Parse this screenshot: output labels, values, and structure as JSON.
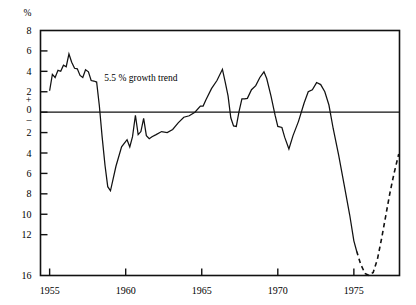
{
  "chart_data": {
    "type": "line",
    "title": "",
    "xlabel": "",
    "ylabel": "%",
    "unit_label": "%",
    "xlim": [
      1954.4,
      1978.0
    ],
    "ylim": [
      -16,
      8
    ],
    "grid": false,
    "legend": "none",
    "yticks": [
      8,
      6,
      4,
      2,
      0,
      -2,
      -4,
      -6,
      -8,
      -10,
      -12,
      -16
    ],
    "ytick_labels": [
      "8",
      "6",
      "4",
      "2",
      "0",
      "2",
      "4",
      "6",
      "8",
      "10",
      "12",
      "16"
    ],
    "y_zero_plus": "+",
    "y_zero_minus": "–",
    "xticks": [
      1955,
      1960,
      1965,
      1970,
      1975
    ],
    "xtick_labels": [
      "1955",
      "1960",
      "1965",
      "1970",
      "1975"
    ],
    "x_minor_ticks": [
      1955,
      1960,
      1965,
      1970,
      1975
    ],
    "annotations": [
      {
        "text": "5.5 % growth trend",
        "x": 1961.0,
        "y": 3.1
      }
    ],
    "reference_lines": [
      {
        "name": "zero-line",
        "y": 0,
        "style": "solid"
      }
    ],
    "series": [
      {
        "name": "growth-rate-actual",
        "style": "solid",
        "color": "#111111",
        "points": [
          [
            1955.0,
            2.1
          ],
          [
            1955.18,
            3.7
          ],
          [
            1955.36,
            3.4
          ],
          [
            1955.55,
            4.1
          ],
          [
            1955.73,
            4.0
          ],
          [
            1955.91,
            4.6
          ],
          [
            1956.09,
            4.45
          ],
          [
            1956.27,
            5.7
          ],
          [
            1956.45,
            4.9
          ],
          [
            1956.64,
            4.3
          ],
          [
            1956.82,
            4.25
          ],
          [
            1957.0,
            3.6
          ],
          [
            1957.18,
            3.4
          ],
          [
            1957.36,
            4.15
          ],
          [
            1957.55,
            3.95
          ],
          [
            1957.73,
            3.1
          ],
          [
            1957.91,
            3.05
          ],
          [
            1958.09,
            2.95
          ],
          [
            1958.27,
            0.6
          ],
          [
            1958.45,
            -2.4
          ],
          [
            1958.64,
            -5.2
          ],
          [
            1958.82,
            -7.3
          ],
          [
            1959.0,
            -7.7
          ],
          [
            1959.36,
            -5.3
          ],
          [
            1959.73,
            -3.4
          ],
          [
            1960.09,
            -2.7
          ],
          [
            1960.27,
            -3.4
          ],
          [
            1960.45,
            -2.4
          ],
          [
            1960.64,
            -0.3
          ],
          [
            1960.82,
            -2.2
          ],
          [
            1961.0,
            -1.9
          ],
          [
            1961.18,
            -0.6
          ],
          [
            1961.36,
            -2.3
          ],
          [
            1961.55,
            -2.6
          ],
          [
            1961.73,
            -2.4
          ],
          [
            1962.0,
            -2.2
          ],
          [
            1962.36,
            -1.9
          ],
          [
            1962.73,
            -2.0
          ],
          [
            1963.09,
            -1.7
          ],
          [
            1963.45,
            -1.05
          ],
          [
            1963.82,
            -0.5
          ],
          [
            1964.18,
            -0.35
          ],
          [
            1964.55,
            0.0
          ],
          [
            1964.91,
            0.6
          ],
          [
            1965.09,
            0.6
          ],
          [
            1965.27,
            1.2
          ],
          [
            1965.64,
            2.3
          ],
          [
            1966.0,
            3.1
          ],
          [
            1966.36,
            4.2
          ],
          [
            1966.55,
            2.9
          ],
          [
            1966.73,
            1.6
          ],
          [
            1966.91,
            -0.55
          ],
          [
            1967.09,
            -1.35
          ],
          [
            1967.27,
            -1.4
          ],
          [
            1967.45,
            0.05
          ],
          [
            1967.64,
            1.3
          ],
          [
            1967.82,
            1.3
          ],
          [
            1968.0,
            1.35
          ],
          [
            1968.27,
            2.2
          ],
          [
            1968.55,
            2.6
          ],
          [
            1968.82,
            3.4
          ],
          [
            1969.09,
            3.95
          ],
          [
            1969.27,
            3.3
          ],
          [
            1969.55,
            1.6
          ],
          [
            1969.82,
            -0.3
          ],
          [
            1970.0,
            -1.4
          ],
          [
            1970.27,
            -1.5
          ],
          [
            1970.45,
            -2.45
          ],
          [
            1970.73,
            -3.6
          ],
          [
            1971.0,
            -2.3
          ],
          [
            1971.36,
            -0.9
          ],
          [
            1971.73,
            0.9
          ],
          [
            1972.0,
            2.0
          ],
          [
            1972.27,
            2.2
          ],
          [
            1972.55,
            2.9
          ],
          [
            1972.82,
            2.7
          ],
          [
            1973.09,
            2.0
          ],
          [
            1973.36,
            0.7
          ],
          [
            1973.64,
            -1.6
          ],
          [
            1974.0,
            -4.2
          ],
          [
            1974.36,
            -7.1
          ],
          [
            1974.73,
            -10.1
          ],
          [
            1975.0,
            -12.6
          ],
          [
            1975.18,
            -13.6
          ]
        ]
      },
      {
        "name": "growth-rate-projected",
        "style": "dashed",
        "color": "#111111",
        "points": [
          [
            1975.18,
            -13.6
          ],
          [
            1975.45,
            -14.9
          ],
          [
            1975.73,
            -15.8
          ],
          [
            1976.0,
            -16.0
          ],
          [
            1976.27,
            -15.7
          ],
          [
            1976.55,
            -14.4
          ],
          [
            1976.82,
            -12.4
          ],
          [
            1977.09,
            -10.2
          ],
          [
            1977.36,
            -8.0
          ],
          [
            1977.64,
            -6.0
          ],
          [
            1977.95,
            -4.1
          ]
        ]
      }
    ]
  }
}
